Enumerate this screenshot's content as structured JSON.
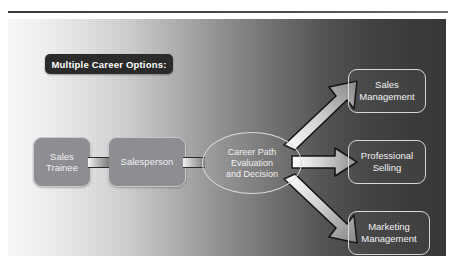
{
  "figure": {
    "title": "Multiple Career Options:",
    "background_left_color": "#fdfdfd",
    "background_right_color": "#373737",
    "node_fill_color": "#8d8d92",
    "node_border_color": "#d7d7da",
    "banner_color": "#2b2b2b",
    "arrow_light_color": "#ffffff",
    "arrow_dark_color": "#8a8a8a",
    "arrow_outline_color": "#111111"
  },
  "nodes": {
    "sales_trainee": {
      "line1": "Sales",
      "line2": "Trainee"
    },
    "salesperson": {
      "line1": "Salesperson"
    },
    "decision": {
      "line1": "Career Path",
      "line2": "Evaluation",
      "line3": "and Decision"
    },
    "sales_management": {
      "line1": "Sales",
      "line2": "Management"
    },
    "professional_selling": {
      "line1": "Professional",
      "line2": "Selling"
    },
    "marketing_management": {
      "line1": "Marketing",
      "line2": "Management"
    }
  },
  "connectors": [
    {
      "from": "sales_trainee",
      "to": "salesperson",
      "style": "bar"
    },
    {
      "from": "salesperson",
      "to": "decision",
      "style": "bar"
    }
  ],
  "arrows": [
    {
      "from": "decision",
      "to": "sales_management",
      "direction": "up-right"
    },
    {
      "from": "decision",
      "to": "professional_selling",
      "direction": "right"
    },
    {
      "from": "decision",
      "to": "marketing_management",
      "direction": "down-right"
    }
  ]
}
